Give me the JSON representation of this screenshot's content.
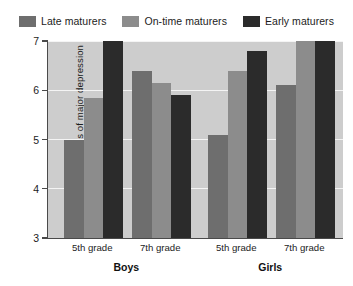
{
  "legend": {
    "entries": [
      {
        "label": "Late maturers",
        "color": "#6e6e6e"
      },
      {
        "label": "On-time maturers",
        "color": "#8c8c8c"
      },
      {
        "label": "Early maturers",
        "color": "#2b2b2b"
      }
    ]
  },
  "axes": {
    "y_title": "Symptoms of major depression",
    "y_ticks": [
      "3",
      "4",
      "5",
      "6",
      "7"
    ],
    "group_labels": [
      "Boys",
      "Girls"
    ],
    "grade_labels": [
      "5th grade",
      "7th grade",
      "5th grade",
      "7th grade"
    ]
  },
  "style": {
    "plot_background": "#cdcdcd",
    "gridline_color": "#f4f4f4",
    "axis_color": "#4a4a4a",
    "page_background": "#ffffff"
  },
  "chart_data": {
    "type": "bar",
    "title": "",
    "subtitle": "",
    "xlabel": "",
    "ylabel": "Symptoms of major depression",
    "ylim": [
      3,
      7
    ],
    "yticks": [
      3,
      4,
      5,
      6,
      7
    ],
    "grid": true,
    "legend_position": "top-center",
    "grouping": "clustered",
    "groups": [
      "Boys",
      "Girls"
    ],
    "categories": [
      "Boys 5th grade",
      "Boys 7th grade",
      "Girls 5th grade",
      "Girls 7th grade"
    ],
    "series": [
      {
        "name": "Late maturers",
        "color": "#6e6e6e",
        "values": [
          5.0,
          6.4,
          5.1,
          6.1
        ]
      },
      {
        "name": "On-time maturers",
        "color": "#8c8c8c",
        "values": [
          5.85,
          6.15,
          6.4,
          7.1
        ]
      },
      {
        "name": "Early maturers",
        "color": "#2b2b2b",
        "values": [
          7.55,
          5.9,
          6.8,
          7.8
        ]
      }
    ]
  }
}
